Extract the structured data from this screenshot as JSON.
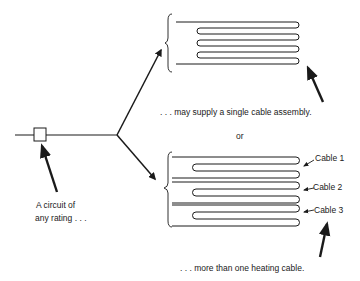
{
  "diagram": {
    "source_label_line1": "A circuit of",
    "source_label_line2": "any rating . . .",
    "single_caption": ". . . may supply a single  cable assembly.",
    "or_label": "or",
    "multi_caption": ". . . more than one  heating cable.",
    "cables": [
      {
        "label": "Cable 1"
      },
      {
        "label": "Cable 2"
      },
      {
        "label": "Cable 3"
      }
    ],
    "colors": {
      "line": "#1a1a1a",
      "background": "#ffffff"
    }
  }
}
